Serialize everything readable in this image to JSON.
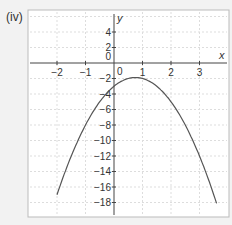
{
  "panel_label": "(iv)",
  "chart_data": {
    "type": "line",
    "title": "",
    "xlabel": "x",
    "ylabel": "y",
    "xlim": [
      -2.5,
      3.9
    ],
    "ylim": [
      -18.2,
      6.2
    ],
    "x_ticks": [
      -2,
      -1,
      0,
      1,
      2,
      3
    ],
    "y_ticks": [
      4,
      2,
      0,
      -2,
      -4,
      -6,
      -8,
      -10,
      -12,
      -14,
      -16,
      -18
    ],
    "grid": true,
    "series": [
      {
        "name": "curve",
        "function": "y = -2x^2 + 3x - 3",
        "x_range": [
          -2,
          3.6
        ],
        "points": [
          [
            -2,
            -17
          ],
          [
            -1.5,
            -12
          ],
          [
            -1,
            -8
          ],
          [
            -0.5,
            -5
          ],
          [
            0,
            -3
          ],
          [
            0.5,
            -2
          ],
          [
            0.75,
            -1.9
          ],
          [
            1,
            -2
          ],
          [
            1.5,
            -3
          ],
          [
            2,
            -5
          ],
          [
            2.5,
            -8
          ],
          [
            3,
            -12
          ],
          [
            3.6,
            -17.1
          ]
        ]
      }
    ]
  }
}
